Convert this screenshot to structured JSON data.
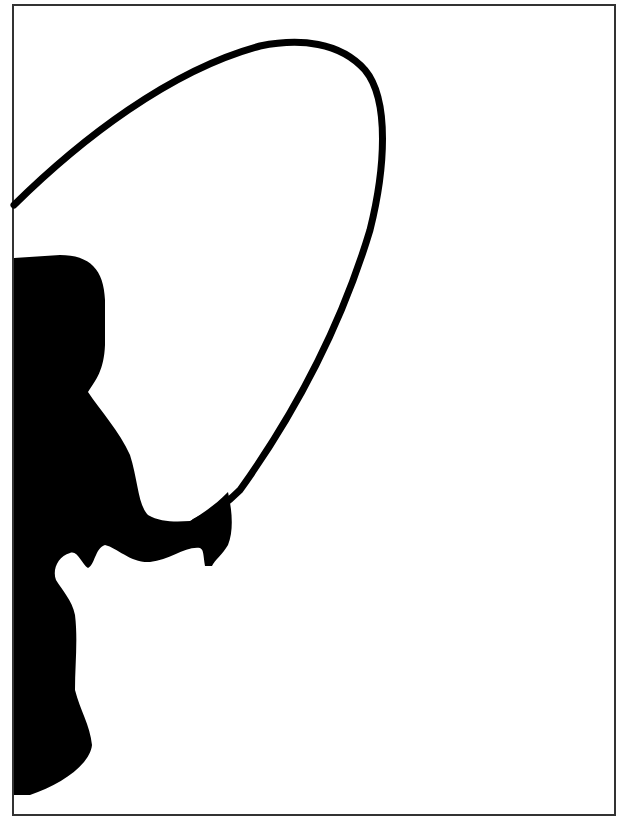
{
  "image": {
    "subject": "Silhouette of a person jumping rope",
    "alt": "Black silhouette of a child swinging a jump rope overhead, cropped at the left edge, inside a thin dark frame",
    "colors": {
      "background": "#ffffff",
      "silhouette": "#000000",
      "frame": "#333333"
    }
  }
}
